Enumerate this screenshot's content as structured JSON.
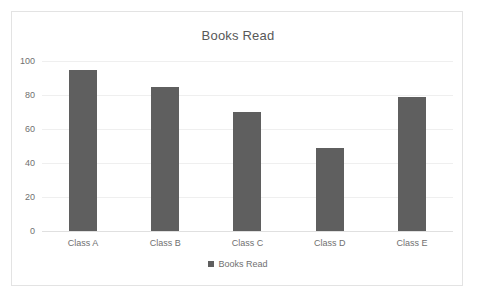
{
  "chart_data": {
    "type": "bar",
    "title": "Books Read",
    "categories": [
      "Class A",
      "Class B",
      "Class C",
      "Class D",
      "Class E"
    ],
    "values": [
      95,
      85,
      70,
      49,
      79
    ],
    "series": [
      {
        "name": "Books Read",
        "values": [
          95,
          85,
          70,
          49,
          79
        ]
      }
    ],
    "xlabel": "",
    "ylabel": "",
    "ylim": [
      0,
      100
    ],
    "yticks": [
      0,
      20,
      40,
      60,
      80,
      100
    ],
    "ytick_labels": [
      "0",
      "20",
      "40",
      "60",
      "80",
      "100"
    ],
    "grid": true,
    "legend": {
      "position": "bottom",
      "entries": [
        "Books Read"
      ]
    },
    "colors": {
      "bar": "#5f5f5f",
      "gridline": "#efefef",
      "axis": "#e0e0e0",
      "title_text": "#585858",
      "tick_text": "#707070",
      "border": "#e3e3e3",
      "background": "#ffffff"
    }
  }
}
